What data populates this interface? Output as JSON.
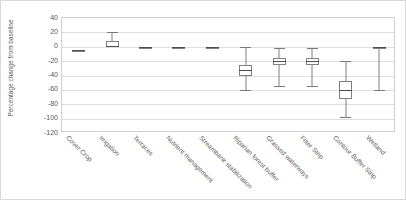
{
  "chart_data": {
    "type": "box",
    "title": "",
    "xlabel": "",
    "ylabel": "Percentage change from baseline",
    "ylim": [
      -120,
      40
    ],
    "ytick_step": 20,
    "grid": true,
    "legend": "none",
    "yticks": [
      "40",
      "20",
      "0",
      "-20",
      "-40",
      "-60",
      "-80",
      "-100",
      "-120"
    ],
    "categories": [
      "Cover Crop",
      "Irrigation",
      "Terraces",
      "Nutrient management",
      "Streambank stabilization",
      "Riparian forest buffer",
      "Grassed waterways",
      "Filter Strip",
      "Contour Buffer Strip",
      "Wetland"
    ],
    "boxes": [
      {
        "category": "Cover Crop",
        "whisker_low": -6,
        "q1": -6,
        "median": -5,
        "q3": -4,
        "whisker_high": -4
      },
      {
        "category": "Irrigation",
        "whisker_low": 0,
        "q1": 0,
        "median": 1,
        "q3": 8,
        "whisker_high": 20
      },
      {
        "category": "Terraces",
        "whisker_low": -1,
        "q1": -1,
        "median": 0,
        "q3": 0,
        "whisker_high": 0
      },
      {
        "category": "Nutrient management",
        "whisker_low": -1,
        "q1": -1,
        "median": 0,
        "q3": 0,
        "whisker_high": 0
      },
      {
        "category": "Streambank stabilization",
        "whisker_low": -1,
        "q1": -1,
        "median": 0,
        "q3": 0,
        "whisker_high": 0
      },
      {
        "category": "Riparian forest buffer",
        "whisker_low": -60,
        "q1": -40,
        "median": -32,
        "q3": -25,
        "whisker_high": 0
      },
      {
        "category": "Grassed waterways",
        "whisker_low": -55,
        "q1": -25,
        "median": -20,
        "q3": -15,
        "whisker_high": -2
      },
      {
        "category": "Filter Strip",
        "whisker_low": -55,
        "q1": -25,
        "median": -20,
        "q3": -15,
        "whisker_high": -2
      },
      {
        "category": "Contour Buffer Strip",
        "whisker_low": -98,
        "q1": -72,
        "median": -60,
        "q3": -48,
        "whisker_high": -20
      },
      {
        "category": "Wetland",
        "whisker_low": -60,
        "q1": -2,
        "median": -1,
        "q3": 0,
        "whisker_high": 0
      }
    ]
  },
  "colors": {
    "box_stroke": "#808080",
    "median_stroke": "#4d4d4d",
    "gridline": "#dedede",
    "frame": "#d0d0d0",
    "text": "#595959",
    "background": "#ffffff"
  }
}
